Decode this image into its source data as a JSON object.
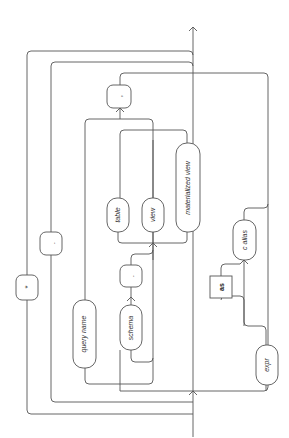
{
  "diagram": {
    "type": "railroad-syntax-diagram",
    "orientation": "rotated-90-ccw",
    "nodes": {
      "star": "*",
      "dot_outer": ".",
      "comma": ",",
      "query_name": "query name",
      "schema": "schema",
      "dot_inner": ".",
      "table": "table",
      "view": "view",
      "materialized_view": "materialized view",
      "as": "as",
      "c_alias": "c alias",
      "expr": "expr"
    }
  }
}
